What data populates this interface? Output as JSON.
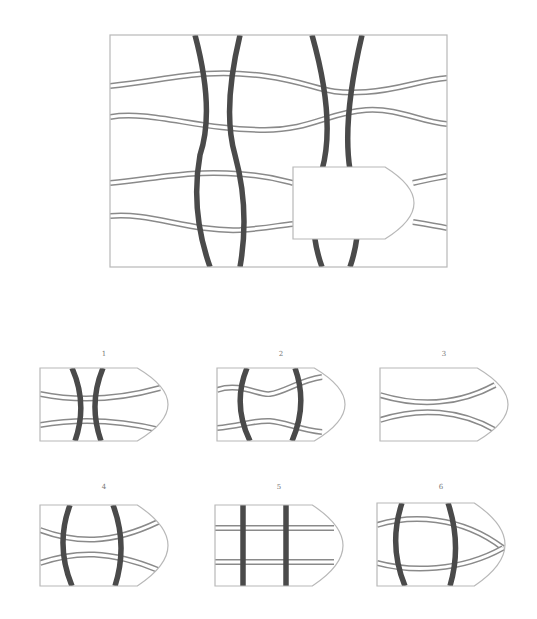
{
  "puzzle": {
    "description": "Visual reasoning puzzle: choose the piece that fills the blank region",
    "colors": {
      "thick_line": "#4a4a4a",
      "thin_line": "#8a8a8a",
      "frame": "#b8b8b8",
      "background": "#ffffff"
    },
    "main_frame": {
      "x": 110,
      "y": 35,
      "w": 337,
      "h": 232
    },
    "missing_piece": {
      "x": 293,
      "y": 167,
      "w": 121,
      "h": 72,
      "notch_x": 385,
      "tip_y": 203
    },
    "main_thick_curves": [
      "M 195 35 Q 215 110 200 155 Q 190 210 210 267",
      "M 240 35 Q 222 110 235 155 Q 250 210 240 267",
      "M 312 35 Q 336 120 322 170 Q 305 220 322 267",
      "M 362 35 Q 342 120 350 170 Q 366 220 350 267"
    ],
    "main_thin_bands": [
      "M 110 86 C 170 80 200 68 265 76 C 320 84 320 95 366 92 C 400 90 420 80 447 78",
      "M 110 117 C 150 110 200 130 265 130 C 310 130 330 112 366 110 C 400 108 420 122 447 124",
      "M 110 183 C 160 178 190 170 240 174 C 270 176 280 180 293 183",
      "M 413 183 C 425 180 437 178 447 176",
      "M 110 216 C 150 212 190 232 240 230 C 270 228 280 225 293 224",
      "M 413 222 C 425 224 437 226 447 228"
    ],
    "options": [
      {
        "label": "1",
        "x": 40,
        "y": 368,
        "w": 128,
        "h": 73,
        "thick": [
          "M 72 368 Q 88 404 75 441",
          "M 103 368 Q 88 404 101 441"
        ],
        "thin": [
          "M 40 394 C 70 400 110 402 160 388",
          "M 40 425 C 70 420 110 418 160 430"
        ]
      },
      {
        "label": "2",
        "x": 217,
        "y": 368,
        "w": 128,
        "h": 73,
        "thick": [
          "M 247 368 Q 232 404 250 441",
          "M 295 368 Q 308 404 292 441"
        ],
        "thin": [
          "M 217 390 C 240 382 260 396 270 394 C 285 392 300 380 322 377",
          "M 217 428 C 240 426 255 420 270 421 C 285 422 300 430 322 432"
        ]
      },
      {
        "label": "3",
        "x": 380,
        "y": 368,
        "w": 128,
        "h": 73,
        "thin": [
          "M 380 395 C 420 407 460 404 495 385",
          "M 380 420 C 420 407 460 410 495 430"
        ]
      },
      {
        "label": "4",
        "x": 40,
        "y": 505,
        "w": 128,
        "h": 81,
        "thick": [
          "M 70 505 Q 55 545 72 586",
          "M 113 505 Q 128 545 115 586"
        ],
        "thin": [
          "M 40 530 C 75 543 110 545 158 522",
          "M 40 563 C 75 551 110 550 158 570"
        ]
      },
      {
        "label": "5",
        "x": 215,
        "y": 505,
        "w": 128,
        "h": 81,
        "thick": [
          "M 243 505 L 243 586",
          "M 286 505 L 286 586"
        ],
        "thin": [
          "M 215 528 L 334 528",
          "M 215 562 L 334 562"
        ]
      },
      {
        "label": "6",
        "x": 377,
        "y": 503,
        "w": 128,
        "h": 83,
        "thick": [
          "M 402 503 Q 388 545 405 586",
          "M 448 503 Q 462 545 450 586"
        ],
        "thin": [
          "M 377 525 C 410 515 460 515 503 548",
          "M 377 563 C 410 572 460 572 503 548"
        ]
      }
    ]
  }
}
